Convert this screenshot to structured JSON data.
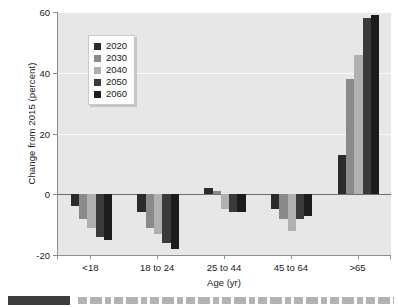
{
  "chart_data": {
    "type": "bar",
    "title": "",
    "subtitle": "",
    "xlabel": "Age (yr)",
    "ylabel": "Change from 2015 (percent)",
    "categories": [
      "<18",
      "18 to 24",
      "25 to 44",
      "45 to 64",
      ">65"
    ],
    "series": [
      {
        "name": "2020",
        "color": "#2b2b2b",
        "values": [
          -4,
          -6,
          2,
          -5,
          13
        ]
      },
      {
        "name": "2030",
        "color": "#8a8a8a",
        "values": [
          -8,
          -11,
          1,
          -8,
          38
        ]
      },
      {
        "name": "2040",
        "color": "#b0b0b0",
        "values": [
          -11,
          -13,
          -5,
          -12,
          46
        ]
      },
      {
        "name": "2050",
        "color": "#3a3a3a",
        "values": [
          -14,
          -16,
          -6,
          -8,
          58
        ]
      },
      {
        "name": "2060",
        "color": "#1c1c1c",
        "values": [
          -15,
          -18,
          -6,
          -7,
          59
        ]
      }
    ],
    "ylim": [
      -20,
      60
    ],
    "yticks": [
      -20,
      0,
      20,
      40,
      60
    ],
    "ytick_labels": [
      "-20",
      "0",
      "20",
      "40",
      "60"
    ],
    "grid": true,
    "gridlines_at": [
      20,
      40,
      60
    ],
    "zero_line": 0,
    "legend_position": "upper left inside",
    "legend_entries": [
      "2020",
      "2030",
      "2040",
      "2050",
      "2060"
    ],
    "plot_background": "#e7e7e7",
    "grid_color": "#fafafa",
    "axis_color": "#8c8c8c",
    "text_color": "#1a1a1a"
  },
  "axis": {
    "y_title": "Change from 2015 (percent)",
    "x_title": "Age (yr)"
  },
  "legend": {
    "items": [
      {
        "label": "2020"
      },
      {
        "label": "2030"
      },
      {
        "label": "2040"
      },
      {
        "label": "2050"
      },
      {
        "label": "2060"
      }
    ]
  }
}
